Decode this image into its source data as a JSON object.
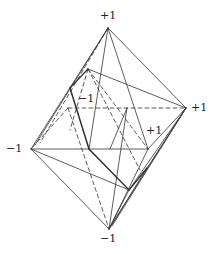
{
  "diagram": {
    "stroke_color": "#333333",
    "labels": {
      "top": "+1",
      "right": "+1",
      "left": "−1",
      "bottom": "−1",
      "back": "−1",
      "front": "+1"
    },
    "vertices": {
      "top": [
        108,
        28
      ],
      "bottom": [
        109,
        229
      ],
      "left": [
        31,
        149
      ],
      "right": [
        186,
        108
      ],
      "back": [
        68,
        108
      ],
      "front": [
        148,
        149
      ]
    },
    "solid_edges": [
      [
        "top",
        "left"
      ],
      [
        "top",
        "right"
      ],
      [
        "top",
        "front"
      ],
      [
        "bottom",
        "left"
      ],
      [
        "bottom",
        "right"
      ],
      [
        "bottom",
        "front"
      ],
      [
        "left",
        "front"
      ],
      [
        "right",
        "front"
      ]
    ],
    "dashed_edges": [
      [
        "back",
        "right"
      ],
      [
        "back",
        "top"
      ],
      [
        "back",
        "left"
      ],
      [
        "back",
        "bottom"
      ]
    ]
  }
}
